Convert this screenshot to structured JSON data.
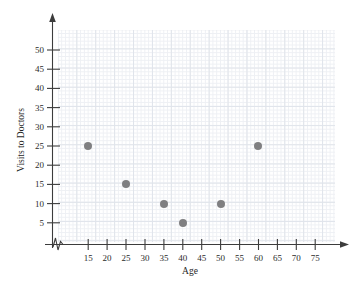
{
  "chart_data": {
    "type": "scatter",
    "title": "",
    "xlabel": "Age",
    "ylabel": "Visits to Doctors",
    "xlim": [
      10,
      78
    ],
    "ylim": [
      0,
      55
    ],
    "xticks": [
      15,
      20,
      25,
      30,
      35,
      40,
      45,
      50,
      55,
      60,
      65,
      70,
      75
    ],
    "yticks": [
      5,
      10,
      15,
      20,
      25,
      30,
      35,
      40,
      45,
      50
    ],
    "xtick_labels": [
      "15",
      "20",
      "25",
      "30",
      "35",
      "40",
      "45",
      "50",
      "55",
      "60",
      "65",
      "70",
      "75"
    ],
    "ytick_labels": [
      "5",
      "10",
      "15",
      "20",
      "25",
      "30",
      "35",
      "40",
      "45",
      "50"
    ],
    "grid": true,
    "legend": false,
    "x": [
      15,
      25,
      35,
      40,
      50,
      60
    ],
    "y": [
      25,
      15,
      10,
      5,
      10,
      25
    ],
    "points": [
      {
        "x": 15,
        "y": 25
      },
      {
        "x": 25,
        "y": 15
      },
      {
        "x": 35,
        "y": 10
      },
      {
        "x": 40,
        "y": 5
      },
      {
        "x": 50,
        "y": 10
      },
      {
        "x": 60,
        "y": 25
      }
    ],
    "marker_color": "#7f7f81",
    "axis_color": "#3c3c3c",
    "grid_color": "#dfe3ea",
    "axis_break": "x-axis-break-near-origin"
  }
}
